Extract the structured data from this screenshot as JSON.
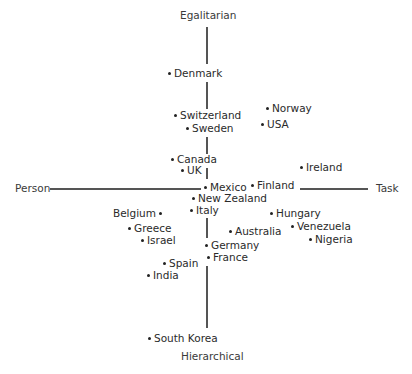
{
  "chart_data": {
    "type": "scatter",
    "title": "",
    "axes": {
      "top": "Egalitarian",
      "bottom": "Hierarchical",
      "left": "Person",
      "right": "Task"
    },
    "xlabel": "Person ← → Task",
    "ylabel": "Hierarchical ← → Egalitarian",
    "grid": false,
    "legend": null,
    "points": [
      {
        "label": "Denmark",
        "x": 170,
        "y": 73,
        "side": "right"
      },
      {
        "label": "Switzerland",
        "x": 176,
        "y": 115,
        "side": "right"
      },
      {
        "label": "Sweden",
        "x": 188,
        "y": 128,
        "side": "right"
      },
      {
        "label": "Norway",
        "x": 268,
        "y": 108,
        "side": "right"
      },
      {
        "label": "USA",
        "x": 263,
        "y": 124,
        "side": "right"
      },
      {
        "label": "Canada",
        "x": 173,
        "y": 159,
        "side": "right"
      },
      {
        "label": "UK",
        "x": 183,
        "y": 170,
        "side": "right"
      },
      {
        "label": "Ireland",
        "x": 302,
        "y": 167,
        "side": "right"
      },
      {
        "label": "Mexico",
        "x": 206,
        "y": 187,
        "side": "right"
      },
      {
        "label": "Finland",
        "x": 253,
        "y": 185,
        "side": "right"
      },
      {
        "label": "New Zealand",
        "x": 194,
        "y": 198,
        "side": "right"
      },
      {
        "label": "Italy",
        "x": 192,
        "y": 210,
        "side": "right"
      },
      {
        "label": "Belgium",
        "x": 159,
        "y": 213,
        "side": "left"
      },
      {
        "label": "Greece",
        "x": 130,
        "y": 228,
        "side": "right"
      },
      {
        "label": "Israel",
        "x": 143,
        "y": 240,
        "side": "right"
      },
      {
        "label": "Hungary",
        "x": 272,
        "y": 213,
        "side": "right"
      },
      {
        "label": "Venezuela",
        "x": 293,
        "y": 226,
        "side": "right"
      },
      {
        "label": "Nigeria",
        "x": 311,
        "y": 239,
        "side": "right"
      },
      {
        "label": "Australia",
        "x": 231,
        "y": 231,
        "side": "right"
      },
      {
        "label": "Germany",
        "x": 207,
        "y": 245,
        "side": "right"
      },
      {
        "label": "France",
        "x": 209,
        "y": 257,
        "side": "right"
      },
      {
        "label": "Spain",
        "x": 165,
        "y": 263,
        "side": "right"
      },
      {
        "label": "India",
        "x": 149,
        "y": 275,
        "side": "right"
      },
      {
        "label": "South Korea",
        "x": 150,
        "y": 338,
        "side": "right"
      }
    ]
  }
}
